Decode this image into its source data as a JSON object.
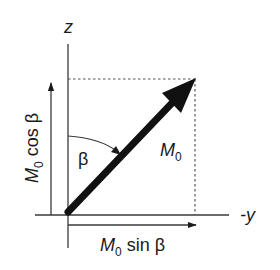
{
  "diagram": {
    "type": "vector-decomposition",
    "axes": {
      "vertical": {
        "label": "z"
      },
      "horizontal": {
        "label": "-y"
      }
    },
    "vector": {
      "label": "M",
      "subscript": "0"
    },
    "angle": {
      "label": "β"
    },
    "components": {
      "vertical": {
        "label_main": "M",
        "label_sub": "0",
        "label_rest": " cos β"
      },
      "horizontal": {
        "label_main": "M",
        "label_sub": "0",
        "label_rest": " sin β"
      }
    },
    "colors": {
      "line": "#3a3a3a",
      "vector": "#111111",
      "dashed": "#555555",
      "text": "#1a1a1a"
    }
  }
}
